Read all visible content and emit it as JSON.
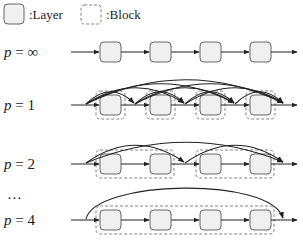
{
  "legend": {
    "layer_label": ":Layer",
    "block_label": ":Block"
  },
  "rows": [
    {
      "id": "p-inf",
      "label_var": "p",
      "label_eq": " = ",
      "label_val": "∞",
      "layers": 4,
      "block_size": null,
      "y": 52
    },
    {
      "id": "p-1",
      "label_var": "p",
      "label_eq": " = ",
      "label_val": "1",
      "layers": 4,
      "block_size": 1,
      "y": 105
    },
    {
      "id": "p-2",
      "label_var": "p",
      "label_eq": " = ",
      "label_val": "2",
      "layers": 4,
      "block_size": 2,
      "y": 164
    },
    {
      "id": "p-4",
      "label_var": "p",
      "label_eq": " = ",
      "label_val": "4",
      "layers": 4,
      "block_size": 4,
      "y": 220
    }
  ],
  "ellipsis": "…",
  "colors": {
    "layer_fill": "#f0f0f0",
    "layer_stroke": "#555555",
    "block_stroke": "#777777",
    "line": "#222222"
  }
}
